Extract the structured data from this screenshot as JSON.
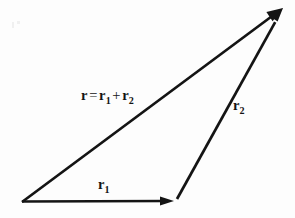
{
  "figure": {
    "name": "vector-addition-triangle",
    "background_color": "#fdfdfd",
    "ink_color": "#141414",
    "width": 295,
    "height": 218
  },
  "labels": {
    "resultant": {
      "r": "r",
      "equals": "=",
      "r1": "r",
      "sub1": "1",
      "plus": "+",
      "r2": "r",
      "sub2": "2",
      "plain_text": "r = r1 + r2"
    },
    "vector_r2": {
      "base": "r",
      "sub": "2",
      "plain_text": "r2"
    },
    "vector_r1": {
      "base": "r",
      "sub": "1",
      "plain_text": "r1"
    }
  },
  "geometry": {
    "origin": {
      "x": 22,
      "y": 202
    },
    "corner": {
      "x": 174,
      "y": 201
    },
    "apex": {
      "x": 283,
      "y": 8
    },
    "vectors": [
      {
        "name": "r1",
        "from": [
          22,
          202
        ],
        "to": [
          174,
          201
        ],
        "arrowhead": true
      },
      {
        "name": "r2",
        "from": [
          177,
          199
        ],
        "to": [
          283,
          8
        ],
        "arrowhead": true
      },
      {
        "name": "resultant",
        "from": [
          22,
          202
        ],
        "to": [
          283,
          8
        ],
        "arrowhead": true
      }
    ]
  }
}
